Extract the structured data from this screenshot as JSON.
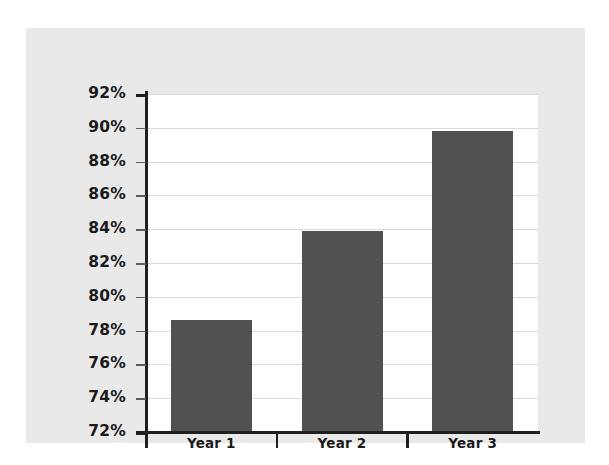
{
  "chart_data": {
    "type": "bar",
    "title": "",
    "subtitle": "",
    "xlabel": "",
    "ylabel": "",
    "categories": [
      "Year 1",
      "Year 2",
      "Year 3"
    ],
    "values": [
      78.6,
      83.9,
      89.8
    ],
    "value_suffix": "%",
    "ylim": [
      72,
      92
    ],
    "ytick_step": 2,
    "ytick_labels": [
      "92%",
      "90%",
      "88%",
      "86%",
      "84%",
      "82%",
      "80%",
      "78%",
      "76%",
      "74%",
      "72%"
    ],
    "ytick_values": [
      92,
      90,
      88,
      86,
      84,
      82,
      80,
      78,
      76,
      74,
      72
    ],
    "grid": true,
    "legend": false,
    "legend_position": "none",
    "series": [
      {
        "name": "",
        "values": [
          78.6,
          83.9,
          89.8
        ]
      }
    ],
    "colors": {
      "bar": "#515151",
      "panel_background": "#e9e9e9",
      "plot_background": "#ffffff",
      "gridline": "#d9d9d9",
      "axis": "#1f1f1f",
      "text": "#1a1a1a",
      "figure_background": "#ffffff"
    }
  }
}
